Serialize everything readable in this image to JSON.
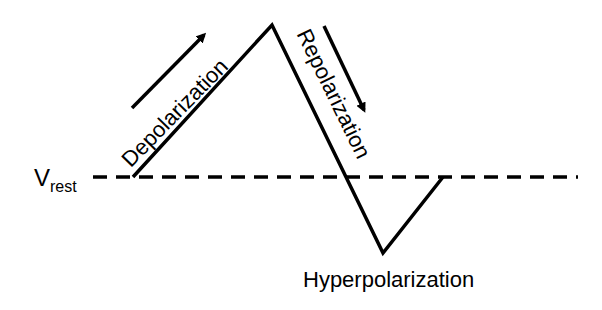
{
  "diagram": {
    "colors": {
      "line": "#000000",
      "background": "#ffffff"
    },
    "baseline": {
      "label_main": "V",
      "label_sub": "rest",
      "style": "dashed"
    },
    "phases": [
      {
        "id": "depolarization",
        "label": "Depolarization",
        "direction": "up"
      },
      {
        "id": "repolarization",
        "label": "Repolarization",
        "direction": "down"
      },
      {
        "id": "hyperpolarization",
        "label": "Hyperpolarization",
        "direction": "below-rest"
      }
    ],
    "waveform_points": [
      [
        133,
        177
      ],
      [
        272,
        25
      ],
      [
        383,
        253
      ],
      [
        443,
        177
      ]
    ]
  }
}
